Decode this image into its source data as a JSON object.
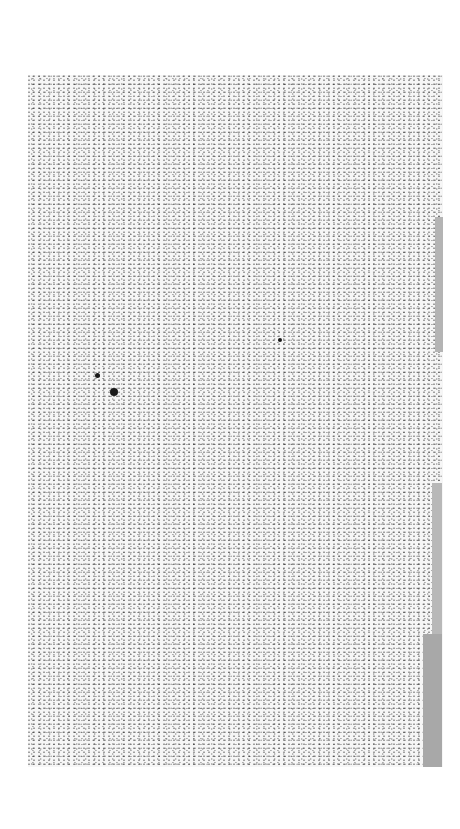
{
  "image": {
    "description": "Scanned textured paper with speckle noise and gray bars along the right edge",
    "paper_region": {
      "x": 28,
      "y": 75,
      "width": 415,
      "height": 692
    },
    "edge_bars": [
      {
        "x": 435,
        "y": 217,
        "width": 8,
        "height": 135,
        "color": "#b4b4b4"
      },
      {
        "x": 432,
        "y": 483,
        "width": 10,
        "height": 152,
        "color": "#b8b8b8"
      },
      {
        "x": 423,
        "y": 634,
        "width": 19,
        "height": 133,
        "color": "#a8a8a8"
      }
    ],
    "spots": [
      {
        "x": 97,
        "y": 375,
        "r": 2.5
      },
      {
        "x": 114,
        "y": 392,
        "r": 4
      },
      {
        "x": 280,
        "y": 340,
        "r": 2
      }
    ],
    "colors": {
      "background": "#ffffff",
      "paper": "#f6f6f6",
      "speckle": "#333333"
    }
  }
}
